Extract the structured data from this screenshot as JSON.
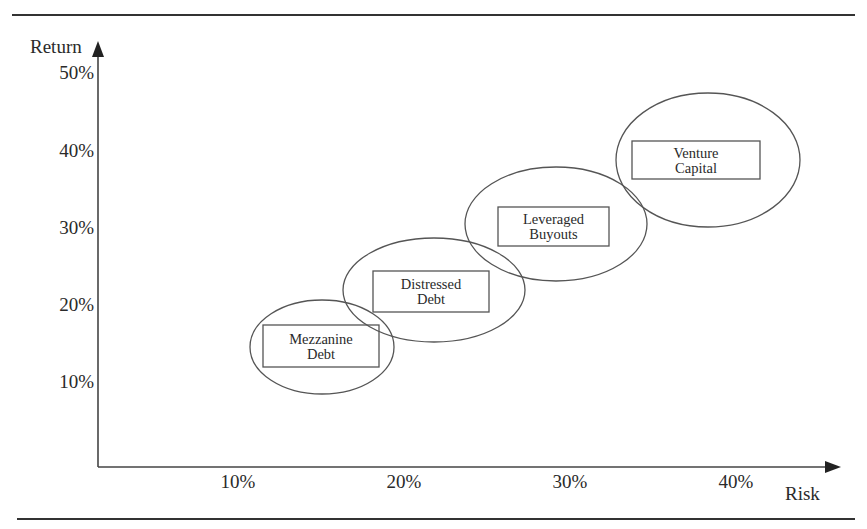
{
  "figure": {
    "title_visible_fragment": "",
    "colors": {
      "ink": "#2a2a2a",
      "rule": "#333333",
      "background": "#ffffff"
    }
  },
  "chart_data": {
    "type": "scatter",
    "subtype": "risk-return bubble diagram (ellipses)",
    "title": "",
    "xlabel": "Risk",
    "ylabel": "Return",
    "x_ticks": [
      "10%",
      "20%",
      "30%",
      "40%"
    ],
    "y_ticks": [
      "10%",
      "20%",
      "30%",
      "40%",
      "50%"
    ],
    "xlim": [
      0,
      0.45
    ],
    "ylim": [
      0,
      0.5
    ],
    "grid": false,
    "legend": null,
    "series": [
      {
        "name": "Mezzanine Debt",
        "label_lines": [
          "Mezzanine",
          "Debt"
        ],
        "risk": 0.15,
        "return": 0.14,
        "risk_range": [
          0.11,
          0.19
        ],
        "return_range": [
          0.08,
          0.2
        ]
      },
      {
        "name": "Distressed Debt",
        "label_lines": [
          "Distressed",
          "Debt"
        ],
        "risk": 0.22,
        "return": 0.22,
        "risk_range": [
          0.16,
          0.27
        ],
        "return_range": [
          0.15,
          0.29
        ]
      },
      {
        "name": "Leveraged Buyouts",
        "label_lines": [
          "Leveraged",
          "Buyouts"
        ],
        "risk": 0.29,
        "return": 0.3,
        "risk_range": [
          0.24,
          0.35
        ],
        "return_range": [
          0.23,
          0.38
        ]
      },
      {
        "name": "Venture Capital",
        "label_lines": [
          "Venture",
          "Capital"
        ],
        "risk": 0.38,
        "return": 0.39,
        "risk_range": [
          0.33,
          0.44
        ],
        "return_range": [
          0.3,
          0.47
        ]
      }
    ]
  },
  "layout": {
    "ellipses": [
      {
        "cx": 322,
        "cy": 347,
        "rx": 72,
        "ry": 47,
        "box": {
          "x": 263,
          "y": 325,
          "w": 116,
          "h": 42
        }
      },
      {
        "cx": 434,
        "cy": 290,
        "rx": 91,
        "ry": 52,
        "box": {
          "x": 373,
          "y": 271,
          "w": 116,
          "h": 41
        }
      },
      {
        "cx": 556,
        "cy": 224,
        "rx": 91,
        "ry": 57,
        "box": {
          "x": 498,
          "y": 207,
          "w": 111,
          "h": 39
        }
      },
      {
        "cx": 708,
        "cy": 160,
        "rx": 92,
        "ry": 67,
        "box": {
          "x": 632,
          "y": 141,
          "w": 128,
          "h": 38
        }
      }
    ],
    "x_tick_px": [
      238,
      404,
      570,
      736
    ],
    "y_tick_px": [
      381,
      304,
      227,
      150,
      72
    ]
  }
}
